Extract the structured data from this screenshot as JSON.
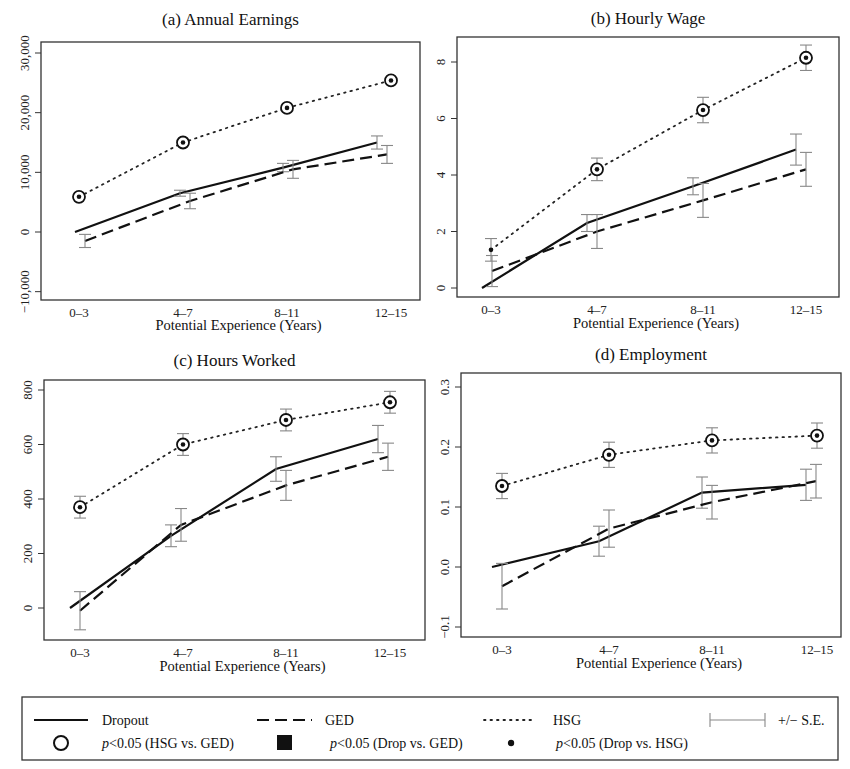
{
  "legend": {
    "dropout": "Dropout",
    "ged": "GED",
    "hsg": "HSG",
    "se": "+/− S.E.",
    "sig_hsg_ged": "(HSG vs. GED)",
    "sig_drop_ged": "(Drop vs. GED)",
    "sig_drop_hsg": "(Drop vs. HSG)",
    "p_label": "p",
    "p_value": "<0.05"
  },
  "chart_data": [
    {
      "type": "line",
      "title": "(a) Annual Earnings",
      "xlabel": "Potential Experience (Years)",
      "ylabel": "",
      "categories": [
        "0–3",
        "4–7",
        "8–11",
        "12–15"
      ],
      "yticks": [
        "−10,000",
        "0",
        "10,000",
        "20,000",
        "30,000"
      ],
      "ylim": [
        -11000,
        32000
      ],
      "series": [
        {
          "name": "Dropout",
          "values": [
            0,
            6500,
            10800,
            15000
          ],
          "se": [
            null,
            500,
            700,
            1100
          ]
        },
        {
          "name": "GED",
          "values": [
            -1500,
            5200,
            10500,
            13000
          ],
          "se": [
            1100,
            1300,
            1500,
            1500
          ]
        },
        {
          "name": "HSG",
          "values": [
            5900,
            15000,
            20800,
            25400
          ],
          "se": [
            300,
            300,
            300,
            300
          ]
        }
      ],
      "markers": {
        "sig_hsg_ged": [
          true,
          true,
          true,
          true
        ],
        "sig_drop_hsg": [
          true,
          true,
          true,
          true
        ]
      }
    },
    {
      "type": "line",
      "title": "(b) Hourly Wage",
      "xlabel": "Potential Experience (Years)",
      "ylabel": "",
      "categories": [
        "0–3",
        "4–7",
        "8–11",
        "12–15"
      ],
      "yticks": [
        "0",
        "2",
        "4",
        "6",
        "8"
      ],
      "ylim": [
        -0.3,
        8.9
      ],
      "series": [
        {
          "name": "Dropout",
          "values": [
            0,
            2.3,
            3.6,
            4.9
          ],
          "se": [
            null,
            0.3,
            0.3,
            0.55
          ]
        },
        {
          "name": "GED",
          "values": [
            0.6,
            2.0,
            3.1,
            4.2
          ],
          "se": [
            0.55,
            0.6,
            0.6,
            0.6
          ]
        },
        {
          "name": "HSG",
          "values": [
            1.35,
            4.2,
            6.3,
            8.15
          ],
          "se": [
            0.4,
            0.4,
            0.45,
            0.45
          ]
        }
      ],
      "markers": {
        "sig_hsg_ged": [
          false,
          true,
          true,
          true
        ],
        "sig_drop_hsg": [
          true,
          true,
          true,
          true
        ]
      }
    },
    {
      "type": "line",
      "title": "(c) Hours Worked",
      "xlabel": "Potential Experience (Years)",
      "ylabel": "",
      "categories": [
        "0–3",
        "4–7",
        "8–11",
        "12–15"
      ],
      "yticks": [
        "0",
        "200",
        "400",
        "600",
        "800"
      ],
      "ylim": [
        -120,
        840
      ],
      "series": [
        {
          "name": "Dropout",
          "values": [
            0,
            265,
            510,
            620
          ],
          "se": [
            null,
            40,
            45,
            50
          ]
        },
        {
          "name": "GED",
          "values": [
            -10,
            305,
            450,
            555
          ],
          "se": [
            70,
            60,
            55,
            50
          ]
        },
        {
          "name": "HSG",
          "values": [
            370,
            600,
            690,
            755
          ],
          "se": [
            40,
            40,
            40,
            40
          ]
        }
      ],
      "markers": {
        "sig_hsg_ged": [
          true,
          true,
          true,
          true
        ],
        "sig_drop_hsg": [
          true,
          true,
          true,
          true
        ]
      }
    },
    {
      "type": "line",
      "title": "(d) Employment",
      "xlabel": "Potential Experience (Years)",
      "ylabel": "",
      "categories": [
        "0–3",
        "4–7",
        "8–11",
        "12–15"
      ],
      "yticks": [
        "−0.1",
        "0.0",
        "0.1",
        "0.2",
        "0.3"
      ],
      "ylim": [
        -0.115,
        0.32
      ],
      "series": [
        {
          "name": "Dropout",
          "values": [
            0.0,
            0.043,
            0.124,
            0.137
          ],
          "se": [
            null,
            0.025,
            0.026,
            0.026
          ]
        },
        {
          "name": "GED",
          "values": [
            -0.032,
            0.064,
            0.108,
            0.143
          ],
          "se": [
            0.038,
            0.031,
            0.028,
            0.028
          ]
        },
        {
          "name": "HSG",
          "values": [
            0.135,
            0.187,
            0.211,
            0.219
          ],
          "se": [
            0.021,
            0.021,
            0.021,
            0.021
          ]
        }
      ],
      "markers": {
        "sig_hsg_ged": [
          true,
          true,
          true,
          true
        ],
        "sig_drop_hsg": [
          true,
          true,
          true,
          true
        ]
      }
    }
  ]
}
